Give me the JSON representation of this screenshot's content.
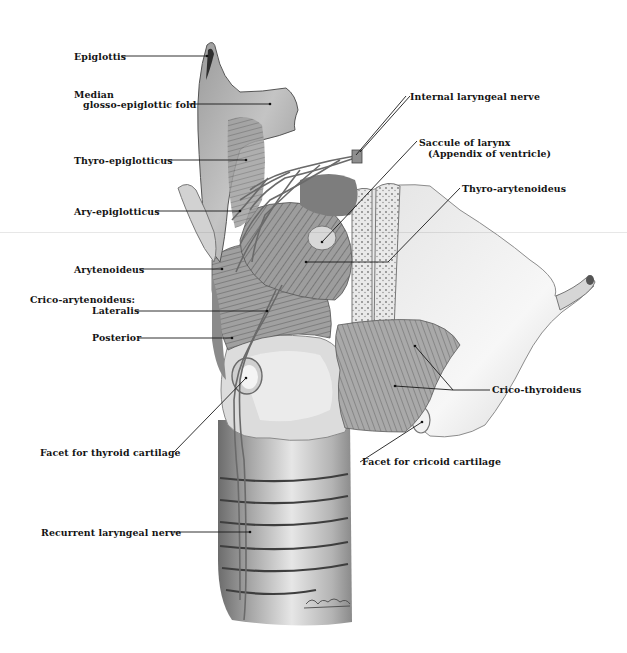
{
  "figure": {
    "signature": "Rubb.",
    "colors": {
      "background": "#ffffff",
      "ink": "#141414",
      "shade_dark": "#5a5a5a",
      "shade_mid": "#9a9a9a",
      "shade_light": "#d8d8d8"
    }
  },
  "labels_left": [
    {
      "id": "epiglottis",
      "text": "Epiglottis",
      "x": 74,
      "y": 52
    },
    {
      "id": "median-fold-1",
      "text": "Median",
      "x": 74,
      "y": 90
    },
    {
      "id": "median-fold-2",
      "text": "glosso-epiglottic fold",
      "x": 83,
      "y": 101
    },
    {
      "id": "thyro-epiglotticus",
      "text": "Thyro-epiglotticus",
      "x": 74,
      "y": 157
    },
    {
      "id": "ary-epiglotticus",
      "text": "Ary-epiglotticus",
      "x": 74,
      "y": 207
    },
    {
      "id": "arytenoideus",
      "text": "Arytenoideus",
      "x": 74,
      "y": 265
    },
    {
      "id": "crico-arytenoideus",
      "text": "Crico-arytenoideus:",
      "x": 30,
      "y": 295
    },
    {
      "id": "lateralis",
      "text": "Lateralis",
      "x": 92,
      "y": 306
    },
    {
      "id": "posterior",
      "text": "Posterior",
      "x": 92,
      "y": 333
    },
    {
      "id": "facet-thyroid",
      "text": "Facet for thyroid cartilage",
      "x": 40,
      "y": 448
    },
    {
      "id": "recurrent-nerve",
      "text": "Recurrent laryngeal nerve",
      "x": 41,
      "y": 528
    }
  ],
  "labels_right": [
    {
      "id": "internal-nerve",
      "text": "Internal laryngeal nerve",
      "x": 410,
      "y": 97
    },
    {
      "id": "saccule-1",
      "text": "Saccule of larynx",
      "x": 419,
      "y": 140
    },
    {
      "id": "saccule-2",
      "text": "(Appendix of ventricle)",
      "x": 428,
      "y": 151
    },
    {
      "id": "thyro-arytenoideus",
      "text": "Thyro-arytenoideus",
      "x": 462,
      "y": 185
    },
    {
      "id": "crico-thyroideus",
      "text": "Crico-thyroideus",
      "x": 492,
      "y": 386
    },
    {
      "id": "facet-cricoid",
      "text": "Facet for cricoid cartilage",
      "x": 362,
      "y": 458
    }
  ]
}
